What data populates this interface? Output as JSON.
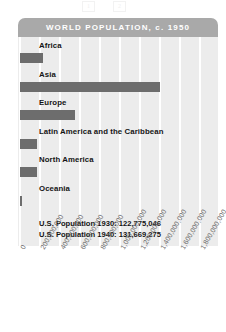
{
  "chart_data": {
    "type": "bar",
    "orientation": "horizontal",
    "title": "WORLD POPULATION, c. 1950",
    "xlabel": "",
    "ylabel": "",
    "xlim": [
      0,
      1900000000
    ],
    "grid": true,
    "legend": "none",
    "categories": [
      "Africa",
      "Asia",
      "Europe",
      "Latin America and the Caribbean",
      "North America",
      "Oceania"
    ],
    "values": [
      230000000,
      1400000000,
      550000000,
      170000000,
      170000000,
      13000000
    ],
    "tick_labels": [
      "0",
      "200,000,000",
      "400,000,000",
      "600,000,000",
      "800,000,000",
      "1,000,000,000",
      "1,200,000,000",
      "1,400,000,000",
      "1,600,000,000",
      "1,800,000,000"
    ],
    "tick_values": [
      0,
      200000000,
      400000000,
      600000000,
      800000000,
      1000000000,
      1200000000,
      1400000000,
      1600000000,
      1800000000
    ],
    "annotations": [
      "U.S. Population 1930: 122,775,046",
      "U.S. Population 1940: 131,669,275"
    ],
    "colors": {
      "bar": "#6d6d6d",
      "plot_background": "#ececec",
      "title_bar": "#a9a9a9",
      "title_text": "#ffffff",
      "gridline": "#ffffff",
      "label_text": "#141414",
      "tick_text": "#6a6a6a"
    }
  },
  "artifacts": {
    "mark_a": "1",
    "mark_b": "2"
  }
}
